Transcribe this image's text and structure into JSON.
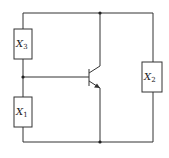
{
  "diagram": {
    "type": "circuit",
    "colors": {
      "line": "#333333",
      "background": "#ffffff"
    },
    "components": [
      {
        "id": "X3",
        "label_main": "X",
        "label_sub": "3",
        "kind": "resistor-box",
        "position": "left-upper"
      },
      {
        "id": "X1",
        "label_main": "X",
        "label_sub": "1",
        "kind": "resistor-box",
        "position": "left-lower"
      },
      {
        "id": "X2",
        "label_main": "X",
        "label_sub": "2",
        "kind": "resistor-box",
        "position": "right"
      },
      {
        "id": "Q",
        "kind": "npn-transistor",
        "position": "center"
      }
    ],
    "junctions": [
      "top-center",
      "bottom-center",
      "left-middle"
    ]
  }
}
